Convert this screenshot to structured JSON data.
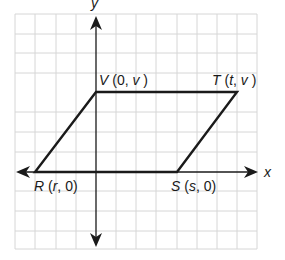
{
  "diagram": {
    "type": "coordinate-plane-parallelogram",
    "axes": {
      "x_label": "x",
      "y_label": "y"
    },
    "grid": {
      "columns": 12,
      "rows": 12,
      "color": "#d6d6d6"
    },
    "vertices": [
      {
        "name": "R",
        "coords": "(r, 0)"
      },
      {
        "name": "S",
        "coords": "(s, 0)"
      },
      {
        "name": "T",
        "coords": "(t, v)"
      },
      {
        "name": "V",
        "coords": "(0, v)"
      }
    ],
    "labels": {
      "R": {
        "letter": "R",
        "open": " (",
        "a": "r",
        "sep": ", ",
        "b": "0",
        "close": ")"
      },
      "S": {
        "letter": "S",
        "open": " (",
        "a": "s",
        "sep": ", ",
        "b": "0",
        "close": ")"
      },
      "T": {
        "letter": "T",
        "open": " (",
        "a": "t",
        "sep": ", ",
        "b": "v",
        "close": " )"
      },
      "V": {
        "letter": "V",
        "open": " (",
        "a": "0",
        "sep": ", ",
        "b": "v",
        "close": " )"
      }
    },
    "colors": {
      "line": "#1a1a1a",
      "grid": "#d6d6d6"
    }
  }
}
